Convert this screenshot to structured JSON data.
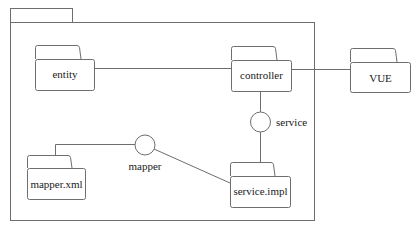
{
  "diagram": {
    "type": "uml-package-diagram",
    "container": {
      "label": ""
    },
    "packages": [
      {
        "id": "entity",
        "label": "entity"
      },
      {
        "id": "controller",
        "label": "controller"
      },
      {
        "id": "vue",
        "label": "VUE"
      },
      {
        "id": "mapper_xml",
        "label": "mapper.xml"
      },
      {
        "id": "service_impl",
        "label": "service.impl"
      }
    ],
    "interfaces": [
      {
        "id": "service",
        "label": "service"
      },
      {
        "id": "mapper",
        "label": "mapper"
      }
    ],
    "connections": [
      {
        "from": "entity",
        "to": "controller"
      },
      {
        "from": "controller",
        "to": "VUE"
      },
      {
        "from": "controller",
        "to": "service"
      },
      {
        "from": "service",
        "to": "service.impl"
      },
      {
        "from": "mapper.xml",
        "to": "mapper"
      },
      {
        "from": "mapper",
        "to": "service.impl"
      }
    ],
    "colors": {
      "line": "#6e6e6e",
      "text": "#1a1a1a",
      "background": "#ffffff"
    }
  }
}
